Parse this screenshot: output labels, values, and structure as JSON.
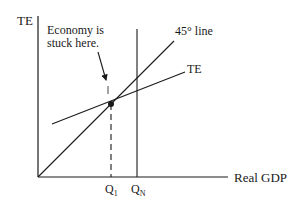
{
  "diagram": {
    "type": "keynesian-cross",
    "y_axis_label": "TE",
    "x_axis_label": "Real GDP",
    "annotation": {
      "line1": "Economy is",
      "line2": "stuck here."
    },
    "lines": {
      "forty_five": {
        "label": "45° line"
      },
      "te": {
        "label": "TE"
      }
    },
    "ticks": {
      "q1": {
        "base": "Q",
        "sub": "1"
      },
      "qn": {
        "base": "Q",
        "sub": "N"
      }
    }
  },
  "colors": {
    "ink": "#1a1a1a",
    "background": "#ffffff"
  }
}
